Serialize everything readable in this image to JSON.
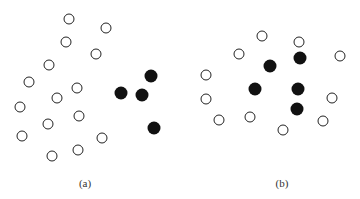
{
  "figure": {
    "panels": [
      {
        "id": "a",
        "label": "(a)",
        "label_pos": [
          85,
          177
        ],
        "open_points": [
          [
            69,
            19
          ],
          [
            106,
            28
          ],
          [
            66,
            42
          ],
          [
            96,
            54
          ],
          [
            49,
            65
          ],
          [
            29,
            82
          ],
          [
            77,
            88
          ],
          [
            57,
            98
          ],
          [
            20,
            107
          ],
          [
            79,
            116
          ],
          [
            48,
            124
          ],
          [
            22,
            136
          ],
          [
            102,
            138
          ],
          [
            78,
            150
          ],
          [
            52,
            156
          ]
        ],
        "filled_points": [
          [
            151,
            76
          ],
          [
            121,
            93
          ],
          [
            142,
            95
          ],
          [
            154,
            128
          ]
        ]
      },
      {
        "id": "b",
        "label": "(b)",
        "label_pos": [
          282,
          177
        ],
        "open_points": [
          [
            262,
            36
          ],
          [
            299,
            42
          ],
          [
            239,
            54
          ],
          [
            340,
            56
          ],
          [
            206,
            75
          ],
          [
            206,
            99
          ],
          [
            332,
            98
          ],
          [
            250,
            117
          ],
          [
            219,
            120
          ],
          [
            323,
            121
          ],
          [
            283,
            130
          ]
        ],
        "filled_points": [
          [
            300,
            58
          ],
          [
            270,
            66
          ],
          [
            255,
            89
          ],
          [
            298,
            89
          ],
          [
            297,
            109
          ]
        ]
      }
    ],
    "colors": {
      "open_stroke": "#222222",
      "filled": "#111111",
      "background": "#ffffff"
    }
  }
}
